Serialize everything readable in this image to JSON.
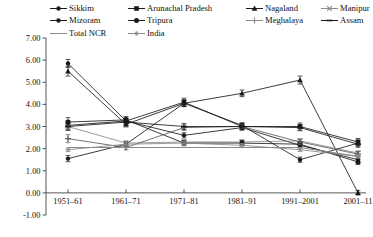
{
  "legend": {
    "rows": [
      [
        {
          "label": "Sikkim",
          "marker": "circle-small",
          "icon": "line-marker-icon",
          "color": "#1a1a1a"
        },
        {
          "label": "Arunachal Pradesh",
          "marker": "square",
          "icon": "line-marker-icon",
          "color": "#1a1a1a"
        },
        {
          "label": "Nagaland",
          "marker": "triangle",
          "icon": "line-marker-icon",
          "color": "#1a1a1a"
        },
        {
          "label": "Manipur",
          "marker": "cross",
          "icon": "line-marker-icon",
          "color": "#8a8a8a"
        }
      ],
      [
        {
          "label": "Mizoram",
          "marker": "circle-small",
          "icon": "line-marker-icon",
          "color": "#1a1a1a"
        },
        {
          "label": "Tripura",
          "marker": "circle",
          "icon": "line-marker-icon",
          "color": "#1a1a1a"
        },
        {
          "label": "Meghalaya",
          "marker": "plus",
          "icon": "line-marker-icon",
          "color": "#5a5a5a"
        },
        {
          "label": "Assam",
          "marker": "dash",
          "icon": "line-marker-icon",
          "color": "#1a1a1a"
        }
      ],
      [
        {
          "label": "Total NCR",
          "marker": "none",
          "icon": "line-marker-icon",
          "color": "#7a7a7a"
        },
        {
          "label": "India",
          "marker": "star",
          "icon": "line-marker-icon",
          "color": "#8a8a8a"
        }
      ]
    ]
  },
  "chart_data": {
    "type": "line",
    "title": "",
    "xlabel": "",
    "ylabel": "",
    "grid": false,
    "legend_position": "top",
    "ylim": [
      -1.0,
      7.0
    ],
    "ytick_labels": [
      "7.00",
      "6.00",
      "5.00",
      "4.00",
      "3.00",
      "2.00",
      "1.00",
      "0.00",
      "-1.00"
    ],
    "yticks": [
      7.0,
      6.0,
      5.0,
      4.0,
      3.0,
      2.0,
      1.0,
      0.0,
      -1.0
    ],
    "categories": [
      "1951–61",
      "1961–71",
      "1971–81",
      "1981–91",
      "1991–2001",
      "2001–11"
    ],
    "series": [
      {
        "name": "Sikkim",
        "marker": "circle-small",
        "color": "#1a1a1a",
        "values": [
          5.85,
          3.25,
          2.6,
          2.95,
          2.15,
          1.5
        ],
        "errors": [
          0.18,
          0.12,
          0.12,
          0.12,
          0.12,
          0.14
        ]
      },
      {
        "name": "Arunachal Pradesh",
        "marker": "square",
        "color": "#1a1a1a",
        "values": [
          3.05,
          3.25,
          4.1,
          3.0,
          3.0,
          2.3
        ],
        "errors": [
          0.22,
          0.18,
          0.18,
          0.14,
          0.16,
          0.16
        ]
      },
      {
        "name": "Nagaland",
        "marker": "triangle",
        "color": "#1a1a1a",
        "values": [
          5.5,
          3.1,
          4.05,
          4.5,
          5.1,
          0.0
        ],
        "errors": [
          0.22,
          0.12,
          0.15,
          0.15,
          0.18,
          0.1
        ]
      },
      {
        "name": "Manipur",
        "marker": "cross",
        "color": "#8a8a8a",
        "values": [
          3.0,
          2.25,
          2.3,
          2.3,
          2.35,
          1.8
        ],
        "errors": [
          0.15,
          0.1,
          0.1,
          0.1,
          0.1,
          0.1
        ]
      },
      {
        "name": "Mizoram",
        "marker": "circle-small",
        "color": "#1a1a1a",
        "values": [
          1.55,
          2.2,
          4.05,
          3.05,
          1.5,
          2.25
        ],
        "errors": [
          0.14,
          0.1,
          0.15,
          0.12,
          0.12,
          0.14
        ]
      },
      {
        "name": "Tripura",
        "marker": "circle",
        "color": "#1a1a1a",
        "values": [
          3.2,
          3.3,
          2.25,
          2.25,
          2.2,
          1.4
        ],
        "errors": [
          0.2,
          0.14,
          0.12,
          0.12,
          0.12,
          0.12
        ]
      },
      {
        "name": "Meghalaya",
        "marker": "plus",
        "color": "#5a5a5a",
        "values": [
          2.45,
          2.05,
          2.95,
          3.0,
          2.3,
          1.75
        ],
        "errors": [
          0.18,
          0.1,
          0.12,
          0.12,
          0.12,
          0.12
        ]
      },
      {
        "name": "Assam",
        "marker": "dash",
        "color": "#1a1a1a",
        "values": [
          3.0,
          3.2,
          3.0,
          3.0,
          2.95,
          2.2
        ],
        "errors": [
          0.16,
          0.14,
          0.14,
          0.14,
          0.14,
          0.14
        ]
      },
      {
        "name": "Total NCR",
        "marker": "none",
        "color": "#8a8a8a",
        "values": [
          2.05,
          2.05,
          2.05,
          2.05,
          2.05,
          1.65
        ],
        "errors": [
          0,
          0,
          0,
          0,
          0,
          0
        ]
      },
      {
        "name": "India",
        "marker": "star",
        "color": "#8a8a8a",
        "values": [
          1.95,
          2.2,
          2.25,
          2.15,
          1.95,
          1.65
        ],
        "errors": [
          0.08,
          0.08,
          0.08,
          0.08,
          0.08,
          0.08
        ]
      }
    ]
  }
}
